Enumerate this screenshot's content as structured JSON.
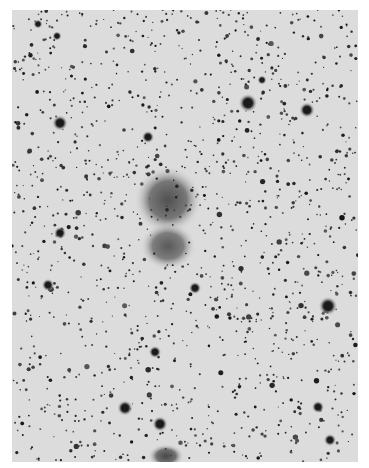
{
  "image": {
    "description": "Negative photographic plate of a dense star field with two overlapping diffuse nebulous objects near center",
    "plate": {
      "x": 12,
      "y": 10,
      "width": 346,
      "height": 452,
      "background": "#dcdcdc"
    },
    "margin_color": "#ffffff",
    "star_color": "#1a1a1a",
    "star_count": 1400,
    "seed": 7
  },
  "bright_stars": [
    {
      "x": 60,
      "y": 123,
      "r": 5
    },
    {
      "x": 248,
      "y": 103,
      "r": 6
    },
    {
      "x": 307,
      "y": 110,
      "r": 5
    },
    {
      "x": 60,
      "y": 233,
      "r": 4
    },
    {
      "x": 328,
      "y": 306,
      "r": 6
    },
    {
      "x": 48,
      "y": 285,
      "r": 4
    },
    {
      "x": 125,
      "y": 408,
      "r": 5
    },
    {
      "x": 160,
      "y": 424,
      "r": 5
    },
    {
      "x": 318,
      "y": 407,
      "r": 4
    },
    {
      "x": 330,
      "y": 440,
      "r": 4
    },
    {
      "x": 155,
      "y": 352,
      "r": 4
    },
    {
      "x": 195,
      "y": 288,
      "r": 4
    },
    {
      "x": 2,
      "y": 255,
      "r": 4
    },
    {
      "x": 148,
      "y": 137,
      "r": 4
    },
    {
      "x": 262,
      "y": 80,
      "r": 3
    },
    {
      "x": 38,
      "y": 24,
      "r": 3
    },
    {
      "x": 57,
      "y": 36,
      "r": 3
    }
  ],
  "nebulae": [
    {
      "name": "upper-blob",
      "x": 168,
      "y": 200,
      "rx": 34,
      "ry": 34,
      "opacity": 0.75
    },
    {
      "name": "lower-blob",
      "x": 168,
      "y": 246,
      "rx": 28,
      "ry": 24,
      "opacity": 0.7
    },
    {
      "name": "bottom-blob",
      "x": 166,
      "y": 456,
      "rx": 18,
      "ry": 12,
      "opacity": 0.8
    }
  ]
}
